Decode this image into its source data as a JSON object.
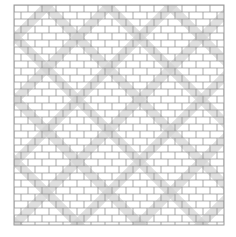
{
  "image": {
    "description": "Line drawing of a brick-bond lattice pattern with diagonal speckled gray bands forming interlocking diamond/zigzag shapes",
    "colors": {
      "background": "#ffffff",
      "line": "#8a8a8a",
      "band": "#d6d6d6",
      "frame": "#9a9a9a"
    },
    "frame": {
      "x": 14,
      "y": 5,
      "width": 210,
      "height": 220
    },
    "brick": {
      "width": 14,
      "height": 7
    },
    "band_width": 9,
    "band_spacing": 62
  }
}
